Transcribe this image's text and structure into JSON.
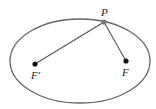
{
  "diagram": {
    "colors": {
      "ellipse": "#666666",
      "lines": "#555555",
      "foci": "#111111",
      "point": "#777777"
    },
    "ellipse": {
      "cx": 80,
      "cy": 61,
      "rx": 70,
      "ry": 42
    },
    "points": {
      "P": {
        "label": "P",
        "x": 104,
        "y": 22
      },
      "F_prime": {
        "label": "F′",
        "x": 35,
        "y": 64
      },
      "F": {
        "label": "F",
        "x": 126,
        "y": 61
      }
    }
  }
}
